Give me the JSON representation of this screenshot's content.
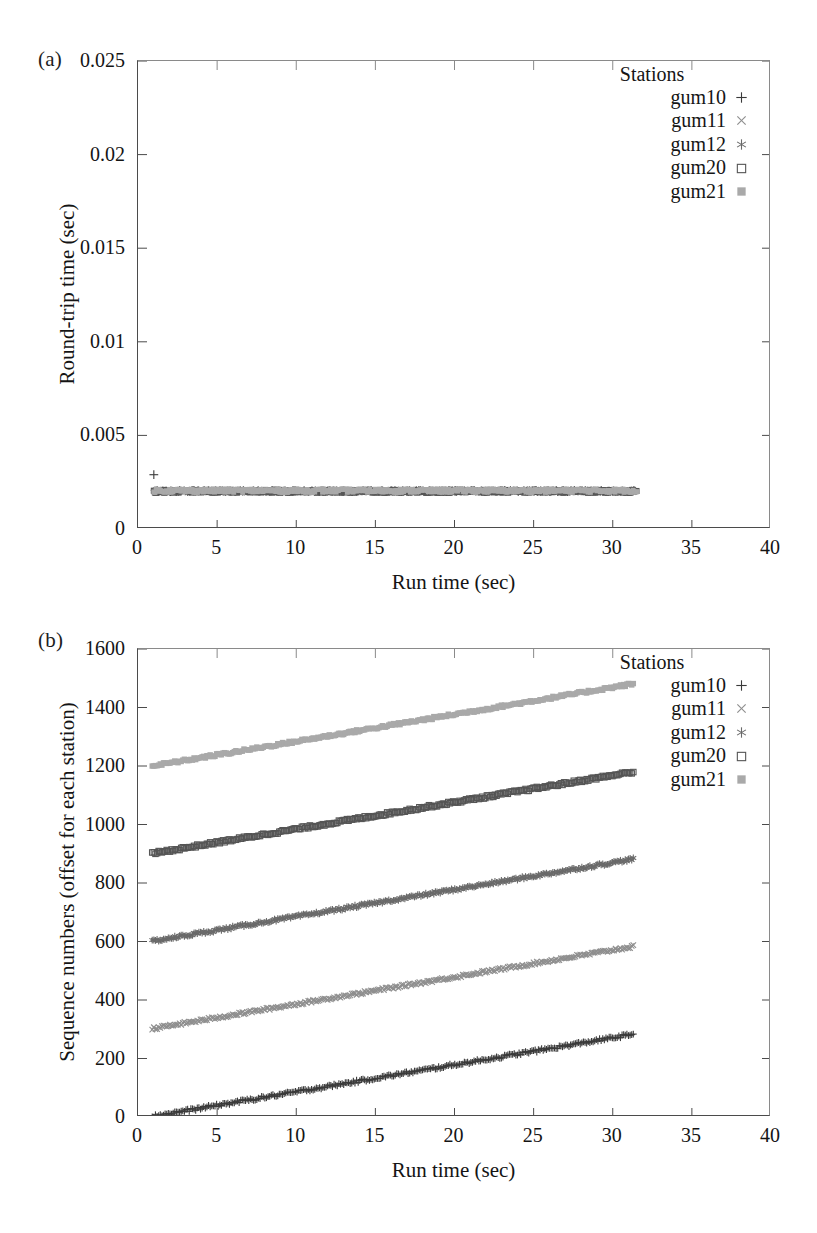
{
  "figure": {
    "panels": [
      {
        "tag": "(a)",
        "xaxis": {
          "label": "Run time (sec)",
          "ticks": [
            "0",
            "5",
            "10",
            "15",
            "20",
            "25",
            "30",
            "35",
            "40"
          ],
          "min": 0,
          "max": 40
        },
        "yaxis": {
          "label": "Round-trip time (sec)",
          "ticks": [
            "0",
            "0.005",
            "0.01",
            "0.015",
            "0.02",
            "0.025"
          ],
          "min": 0,
          "max": 0.025
        },
        "legend": {
          "title": "Stations",
          "entries": [
            {
              "label": "gum10",
              "marker": "plus-icon",
              "color": "#3a3a3a"
            },
            {
              "label": "gum11",
              "marker": "cross-icon",
              "color": "#8e8e8e"
            },
            {
              "label": "gum12",
              "marker": "asterisk-icon",
              "color": "#6a6a6a"
            },
            {
              "label": "gum20",
              "marker": "open-square-icon",
              "color": "#555555"
            },
            {
              "label": "gum21",
              "marker": "filled-square-icon",
              "color": "#a9a9a9"
            }
          ]
        }
      },
      {
        "tag": "(b)",
        "xaxis": {
          "label": "Run time (sec)",
          "ticks": [
            "0",
            "5",
            "10",
            "15",
            "20",
            "25",
            "30",
            "35",
            "40"
          ],
          "min": 0,
          "max": 40
        },
        "yaxis": {
          "label": "Sequence numbers (offset for each station)",
          "ticks": [
            "0",
            "200",
            "400",
            "600",
            "800",
            "1000",
            "1200",
            "1400",
            "1600"
          ],
          "min": 0,
          "max": 1600
        },
        "legend": {
          "title": "Stations",
          "entries": [
            {
              "label": "gum10",
              "marker": "plus-icon",
              "color": "#3a3a3a"
            },
            {
              "label": "gum11",
              "marker": "cross-icon",
              "color": "#8e8e8e"
            },
            {
              "label": "gum12",
              "marker": "asterisk-icon",
              "color": "#6a6a6a"
            },
            {
              "label": "gum20",
              "marker": "open-square-icon",
              "color": "#555555"
            },
            {
              "label": "gum21",
              "marker": "filled-square-icon",
              "color": "#a9a9a9"
            }
          ]
        }
      }
    ]
  },
  "chart_data": [
    {
      "type": "scatter",
      "panel": "(a)",
      "title": "",
      "xlabel": "Run time (sec)",
      "ylabel": "Round-trip time (sec)",
      "xlim": [
        0,
        40
      ],
      "ylim": [
        0,
        0.025
      ],
      "xticks": [
        0,
        5,
        10,
        15,
        20,
        25,
        30,
        35,
        40
      ],
      "yticks": [
        0,
        0.005,
        0.01,
        0.015,
        0.02,
        0.025
      ],
      "grid": false,
      "legend_position": "top-right-inside",
      "note": "All five stations overlap in a single dense horizontal band at ~0.002 s from t=1 to t=31.5; one gum10 outlier at (1.0, 0.0029).",
      "series": [
        {
          "name": "gum10",
          "marker": "plus",
          "color": "#3a3a3a",
          "x_range": [
            1.0,
            31.4
          ],
          "y_mean": 0.00203,
          "y_spread": 0.00012,
          "outliers": [
            {
              "x": 1.0,
              "y": 0.0029
            }
          ]
        },
        {
          "name": "gum11",
          "marker": "cross",
          "color": "#8e8e8e",
          "x_range": [
            1.0,
            31.4
          ],
          "y_mean": 0.00202,
          "y_spread": 0.0001,
          "outliers": []
        },
        {
          "name": "gum12",
          "marker": "asterisk",
          "color": "#6a6a6a",
          "x_range": [
            1.0,
            31.4
          ],
          "y_mean": 0.00204,
          "y_spread": 0.00011,
          "outliers": []
        },
        {
          "name": "gum20",
          "marker": "open-square",
          "color": "#555555",
          "x_range": [
            1.0,
            31.5
          ],
          "y_mean": 0.00201,
          "y_spread": 0.0001,
          "outliers": []
        },
        {
          "name": "gum21",
          "marker": "filled-square",
          "color": "#a9a9a9",
          "x_range": [
            1.0,
            31.5
          ],
          "y_mean": 0.00205,
          "y_spread": 0.00012,
          "outliers": []
        }
      ]
    },
    {
      "type": "scatter",
      "panel": "(b)",
      "title": "",
      "xlabel": "Run time (sec)",
      "ylabel": "Sequence numbers (offset for each station)",
      "xlim": [
        0,
        40
      ],
      "ylim": [
        0,
        1600
      ],
      "xticks": [
        0,
        5,
        10,
        15,
        20,
        25,
        30,
        35,
        40
      ],
      "yticks": [
        0,
        200,
        400,
        600,
        800,
        1000,
        1200,
        1400,
        1600
      ],
      "grid": false,
      "legend_position": "top-right-inside",
      "note": "Five parallel near-linear ramps, each offset by 300 sequence numbers; each rises about 280 counts over ~30 s.",
      "series": [
        {
          "name": "gum10",
          "marker": "plus",
          "color": "#3a3a3a",
          "offset": 0,
          "x_start": 0.9,
          "x_end": 31.3,
          "y_start": 2,
          "y_end": 283
        },
        {
          "name": "gum11",
          "marker": "cross",
          "color": "#8e8e8e",
          "offset": 300,
          "x_start": 0.9,
          "x_end": 31.3,
          "y_start": 302,
          "y_end": 583
        },
        {
          "name": "gum12",
          "marker": "asterisk",
          "color": "#6a6a6a",
          "offset": 600,
          "x_start": 0.9,
          "x_end": 31.3,
          "y_start": 601,
          "y_end": 882
        },
        {
          "name": "gum20",
          "marker": "open-square",
          "color": "#555555",
          "offset": 900,
          "x_start": 0.9,
          "x_end": 31.3,
          "y_start": 901,
          "y_end": 1180
        },
        {
          "name": "gum21",
          "marker": "filled-square",
          "color": "#a9a9a9",
          "offset": 1200,
          "x_start": 0.9,
          "x_end": 31.3,
          "y_start": 1200,
          "y_end": 1481
        }
      ]
    }
  ]
}
